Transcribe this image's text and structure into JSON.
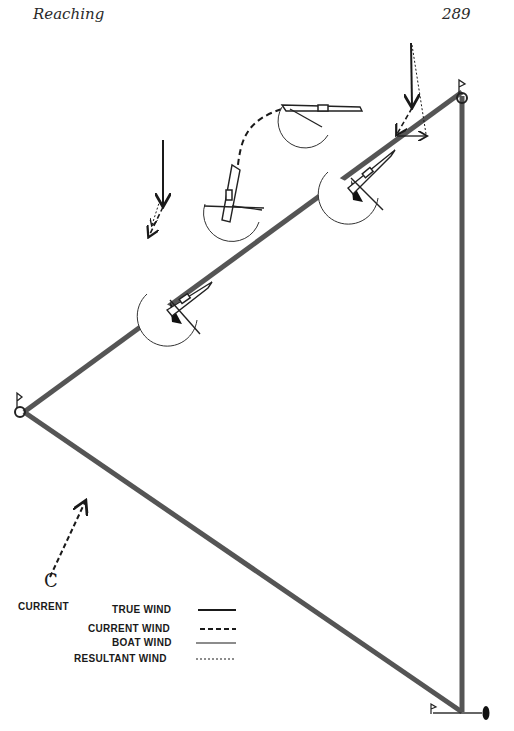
{
  "header": {
    "title": "Reaching",
    "page_number": "289"
  },
  "diagram": {
    "current_label": "CURRENT",
    "current_symbol": "C",
    "legend": [
      {
        "label": "TRUE WIND",
        "style": "solid-thick"
      },
      {
        "label": "CURRENT WIND",
        "style": "dashed"
      },
      {
        "label": "BOAT WIND",
        "style": "solid-thin"
      },
      {
        "label": "RESULTANT WIND",
        "style": "dotted"
      }
    ],
    "colors": {
      "course_line": "#555555",
      "ink": "#1a1a1a",
      "sail_fill": "#111111"
    }
  }
}
